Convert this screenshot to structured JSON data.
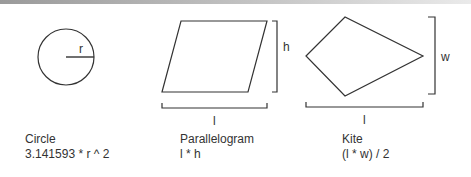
{
  "shapes": [
    {
      "name": "Circle",
      "formula": "3.141593 * r ^ 2",
      "labels": {
        "radius": "r"
      }
    },
    {
      "name": "Parallelogram",
      "formula": "l * h",
      "labels": {
        "height": "h",
        "length": "l"
      }
    },
    {
      "name": "Kite",
      "formula": "(l * w) / 2",
      "labels": {
        "width": "w",
        "length": "l"
      }
    }
  ],
  "colors": {
    "stroke": "#333333",
    "text": "#333333",
    "background": "#ffffff"
  }
}
